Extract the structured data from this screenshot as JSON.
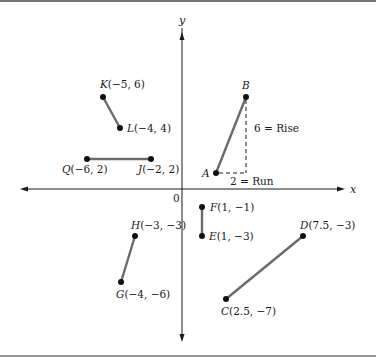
{
  "figure": {
    "axes": {
      "x_label": "x",
      "y_label": "y",
      "origin_label": "0"
    },
    "points": [
      {
        "id": "K",
        "letter": "K",
        "coords": "(−5, 6)",
        "x": -5,
        "y": 6
      },
      {
        "id": "L",
        "letter": "L",
        "coords": "(−4, 4)",
        "x": -4,
        "y": 4
      },
      {
        "id": "Q",
        "letter": "Q",
        "coords": "(−6, 2)",
        "x": -6,
        "y": 2
      },
      {
        "id": "J",
        "letter": "J",
        "coords": "(−2, 2)",
        "x": -2,
        "y": 2
      },
      {
        "id": "A",
        "letter": "A",
        "coords": "",
        "x": null,
        "y": null
      },
      {
        "id": "B",
        "letter": "B",
        "coords": "",
        "x": null,
        "y": null
      },
      {
        "id": "F",
        "letter": "F",
        "coords": "(1, −1)",
        "x": 1,
        "y": -1
      },
      {
        "id": "E",
        "letter": "E",
        "coords": "(1, −3)",
        "x": 1,
        "y": -3
      },
      {
        "id": "H",
        "letter": "H",
        "coords": "(−3, −3)",
        "x": -3,
        "y": -3
      },
      {
        "id": "G",
        "letter": "G",
        "coords": "(−4, −6)",
        "x": -4,
        "y": -6
      },
      {
        "id": "D",
        "letter": "D",
        "coords": "(7.5, −3)",
        "x": 7.5,
        "y": -3
      },
      {
        "id": "C",
        "letter": "C",
        "coords": "(2.5, −7)",
        "x": 2.5,
        "y": -7
      }
    ],
    "segments": [
      {
        "from": "K",
        "to": "L"
      },
      {
        "from": "Q",
        "to": "J"
      },
      {
        "from": "A",
        "to": "B"
      },
      {
        "from": "F",
        "to": "E"
      },
      {
        "from": "H",
        "to": "G"
      },
      {
        "from": "C",
        "to": "D"
      }
    ],
    "annotations": {
      "rise": "6 = Rise",
      "run": "2 = Run"
    },
    "colors": {
      "segment": "#6b6b6b",
      "axis": "#1a1a1a",
      "border": "#777777",
      "point": "#111111"
    }
  }
}
